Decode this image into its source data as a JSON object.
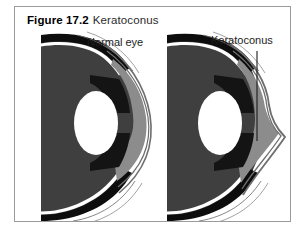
{
  "figure": {
    "number": "Figure 17.2",
    "title": "Keratoconus"
  },
  "diagram": {
    "type": "medical-illustration",
    "panels": [
      {
        "id": "normal-eye",
        "label": "Normal eye",
        "description": "Cross-section of a normal eye showing a smooth, evenly curved dome-shaped cornea"
      },
      {
        "id": "keratoconus-eye",
        "label": "Keratoconus",
        "description": "Cross-section of an eye with keratoconus showing a cone-shaped protruding cornea",
        "pointer": "leader line from label to the conical corneal apex"
      }
    ],
    "structures": [
      "sclera",
      "cornea",
      "iris",
      "lens",
      "anterior chamber"
    ]
  },
  "colors": {
    "frame_border": "#9b9b9b",
    "page_background": "#ffffff",
    "sclera_dark": "#3f3f3f",
    "sclera_band_black": "#0d0d0d",
    "cornea_gray": "#8c8c8c",
    "iris_black": "#141414",
    "lens_white": "#ffffff",
    "outline_gray": "#6e6e6e",
    "pointer_line": "#1a1a1a",
    "caption_text": "#1a1a1a",
    "label_text": "#1c1c1c"
  }
}
